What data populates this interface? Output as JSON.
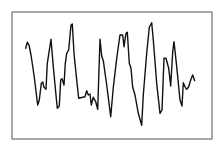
{
  "colors": {
    "background": "#ffffff",
    "frame": "#7a7a7a",
    "line": "#111111"
  },
  "chart_data": {
    "type": "line",
    "title": "",
    "xlabel": "",
    "ylabel": "",
    "grid": false,
    "legend": null,
    "frame": {
      "x": 12,
      "y": 12,
      "width": 200,
      "height": 127
    },
    "series": [
      {
        "name": "waveform",
        "points": [
          [
            25.7,
            48.3
          ],
          [
            27.3,
            42.3
          ],
          [
            29,
            45
          ],
          [
            31,
            55
          ],
          [
            34,
            75
          ],
          [
            37.7,
            105
          ],
          [
            39.3,
            100
          ],
          [
            41.3,
            83.3
          ],
          [
            42.7,
            82
          ],
          [
            44,
            87.3
          ],
          [
            46,
            89.3
          ],
          [
            47.3,
            63.3
          ],
          [
            51,
            39.3
          ],
          [
            53.3,
            66.7
          ],
          [
            55.5,
            90
          ],
          [
            57.3,
            108.3
          ],
          [
            59.3,
            106
          ],
          [
            60.7,
            80
          ],
          [
            62,
            78.7
          ],
          [
            64,
            85
          ],
          [
            65.3,
            63.3
          ],
          [
            66.7,
            53.3
          ],
          [
            68.7,
            50
          ],
          [
            71,
            25
          ],
          [
            72.3,
            24
          ],
          [
            74,
            53.3
          ],
          [
            76.7,
            80
          ],
          [
            78.7,
            98.3
          ],
          [
            82.7,
            97.3
          ],
          [
            85,
            96.7
          ],
          [
            86.7,
            90.7
          ],
          [
            88.3,
            95
          ],
          [
            90,
            94
          ],
          [
            91.3,
            105
          ],
          [
            93.3,
            97.3
          ],
          [
            95.7,
            101.7
          ],
          [
            97.7,
            109.3
          ],
          [
            100,
            39.3
          ],
          [
            101.7,
            56
          ],
          [
            103.3,
            60.7
          ],
          [
            106.7,
            85
          ],
          [
            110.7,
            116.7
          ],
          [
            113.3,
            87.3
          ],
          [
            116.7,
            58.3
          ],
          [
            120,
            35
          ],
          [
            122.7,
            35
          ],
          [
            124,
            46.7
          ],
          [
            126,
            33.3
          ],
          [
            127.3,
            32.3
          ],
          [
            129.3,
            63.3
          ],
          [
            131,
            68.3
          ],
          [
            132.7,
            87.3
          ],
          [
            135,
            95
          ],
          [
            138.3,
            113.3
          ],
          [
            140,
            119.3
          ],
          [
            141.7,
            125.3
          ],
          [
            143.3,
            95
          ],
          [
            146.7,
            53.3
          ],
          [
            149.3,
            27.3
          ],
          [
            151.7,
            22.7
          ],
          [
            153.3,
            40
          ],
          [
            156.7,
            83.3
          ],
          [
            160,
            113.3
          ],
          [
            162,
            110
          ],
          [
            164,
            58.3
          ],
          [
            166,
            58.3
          ],
          [
            168.7,
            68.3
          ],
          [
            170.7,
            86
          ],
          [
            172.7,
            51.7
          ],
          [
            174,
            41.7
          ],
          [
            176.7,
            66.7
          ],
          [
            180,
            100
          ],
          [
            182,
            106
          ],
          [
            183.3,
            82.7
          ],
          [
            185.3,
            87.3
          ],
          [
            186.7,
            89.3
          ],
          [
            188.7,
            86.7
          ],
          [
            190.7,
            80
          ],
          [
            192.7,
            75
          ],
          [
            194.7,
            80.7
          ]
        ]
      }
    ]
  }
}
